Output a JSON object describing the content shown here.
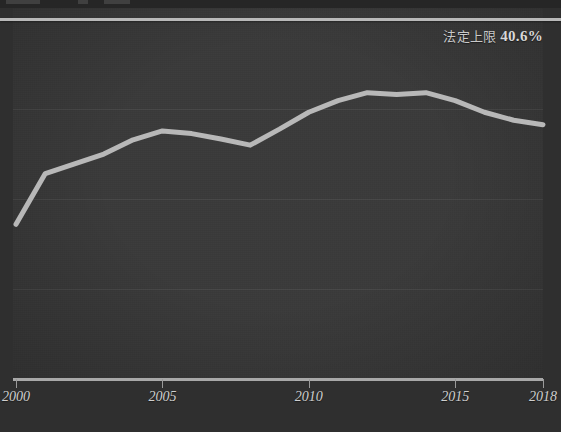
{
  "chart_data": {
    "type": "line",
    "title": "",
    "xlabel": "",
    "ylabel": "",
    "x": [
      2000,
      2001,
      2002,
      2003,
      2004,
      2005,
      2006,
      2007,
      2008,
      2009,
      2010,
      2011,
      2012,
      2013,
      2014,
      2015,
      2016,
      2017,
      2018
    ],
    "tick_labels": [
      "2000",
      "2005",
      "2010",
      "2015",
      "2018"
    ],
    "tick_values": [
      2000,
      2005,
      2010,
      2015,
      2018
    ],
    "xlim": [
      2000,
      2018
    ],
    "ylim": [
      0,
      40.6
    ],
    "grid": true,
    "gridlines_y": [
      30.4,
      20.3,
      10.1
    ],
    "legend_position": "none",
    "series": [
      {
        "name": "保険料率",
        "color": "#b8b8b8",
        "values": [
          17.4,
          23.1,
          24.2,
          25.3,
          26.9,
          27.9,
          27.6,
          27.0,
          26.3,
          28.1,
          30.0,
          31.3,
          32.2,
          32.0,
          32.2,
          31.3,
          30.0,
          29.1,
          28.6
        ]
      }
    ],
    "reference_line": {
      "label": "法定上限",
      "value_text": "40.6%",
      "value": 40.6,
      "color": "#b9b9b9"
    }
  },
  "axis": {
    "x_ticks": [
      {
        "label": "2000",
        "year": 2000
      },
      {
        "label": "2005",
        "year": 2005
      },
      {
        "label": "2010",
        "year": 2010
      },
      {
        "label": "2015",
        "year": 2015
      },
      {
        "label": "2018",
        "year": 2018
      }
    ]
  },
  "colors": {
    "background": "#3a3a3a",
    "outer_background": "#2f2f2f",
    "series": "#b8b8b8",
    "reference": "#b9b9b9",
    "gridline": "#474747",
    "axis": "#a8a8a8",
    "text": "#cfcfcf"
  }
}
